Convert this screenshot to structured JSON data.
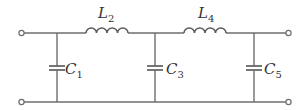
{
  "diagram": {
    "type": "ladder-filter-circuit",
    "terminals": [
      {
        "id": "in-top"
      },
      {
        "id": "in-bottom"
      },
      {
        "id": "out-top"
      },
      {
        "id": "out-bottom"
      }
    ],
    "components": [
      {
        "id": "C1",
        "kind": "capacitor",
        "placement": "shunt",
        "label": "C",
        "subscript": "1"
      },
      {
        "id": "L2",
        "kind": "inductor",
        "placement": "series",
        "label": "L",
        "subscript": "2"
      },
      {
        "id": "C3",
        "kind": "capacitor",
        "placement": "shunt",
        "label": "C",
        "subscript": "3"
      },
      {
        "id": "L4",
        "kind": "inductor",
        "placement": "series",
        "label": "L",
        "subscript": "4"
      },
      {
        "id": "C5",
        "kind": "capacitor",
        "placement": "shunt",
        "label": "C",
        "subscript": "5"
      }
    ],
    "order": [
      "C1",
      "L2",
      "C3",
      "L4",
      "C5"
    ]
  }
}
